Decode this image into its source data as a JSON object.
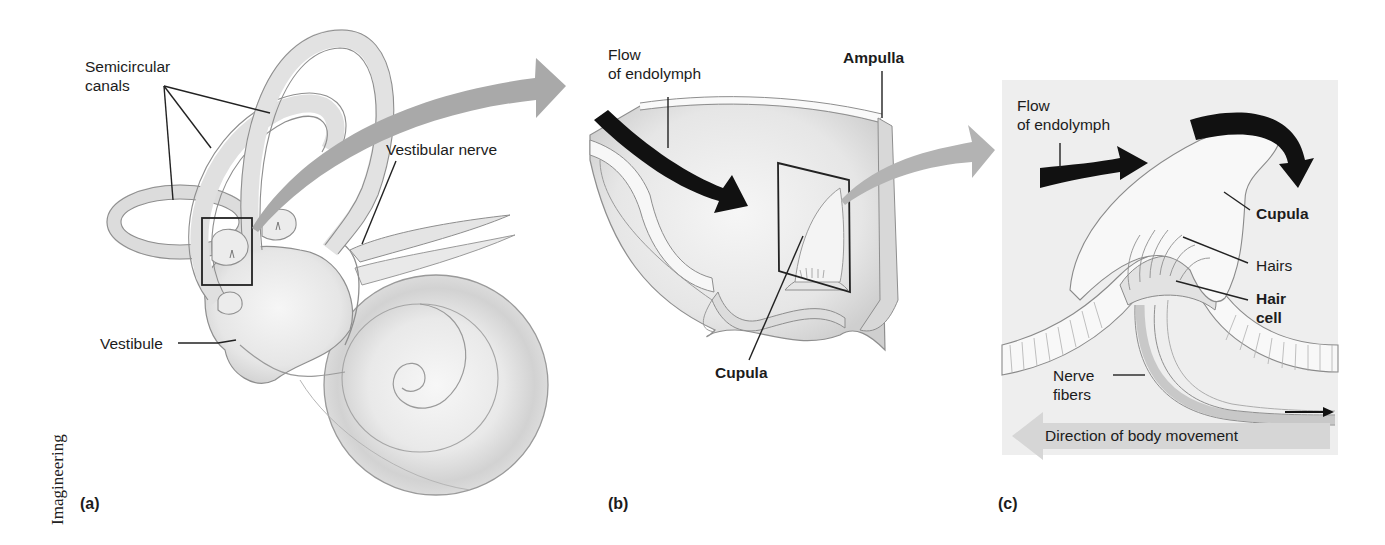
{
  "figure": {
    "credit": "Imagineering",
    "colors": {
      "tissue_fill": "#ececec",
      "tissue_shade": "#d4d4d4",
      "outline": "#8a8a8a",
      "gray_arrow": "#a9a9a9",
      "black_arrow": "#111111",
      "panel_c_bg": "#efefef",
      "direction_arrow": "#d6d6d6",
      "label_text": "#1c1c1c"
    },
    "panels": [
      {
        "id": "a",
        "letter": "(a)",
        "subject": "Inner ear labyrinth",
        "labels": {
          "semicircular_line1": "Semicircular",
          "semicircular_line2": "canals",
          "vestibular_nerve": "Vestibular nerve",
          "vestibule": "Vestibule"
        }
      },
      {
        "id": "b",
        "letter": "(b)",
        "subject": "Ampulla cross-section",
        "labels": {
          "flow_line1": "Flow",
          "flow_line2": "of endolymph",
          "ampulla": "Ampulla",
          "cupula": "Cupula"
        }
      },
      {
        "id": "c",
        "letter": "(c)",
        "subject": "Crista ampullaris detail",
        "labels": {
          "flow_line1": "Flow",
          "flow_line2": "of endolymph",
          "cupula": "Cupula",
          "hairs": "Hairs",
          "hair_cell_line1": "Hair",
          "hair_cell_line2": "cell",
          "nerve_line1": "Nerve",
          "nerve_line2": "fibers",
          "direction": "Direction of body movement"
        }
      }
    ]
  }
}
